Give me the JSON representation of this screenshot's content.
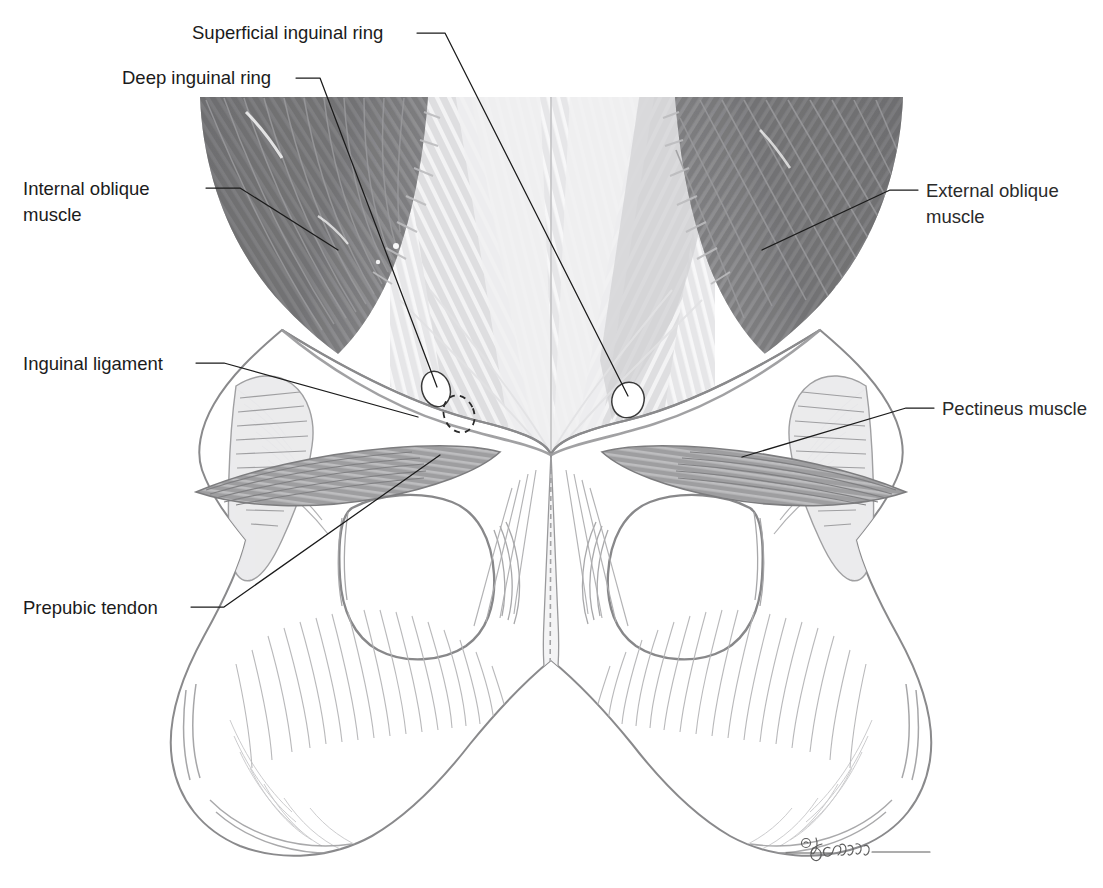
{
  "figure": {
    "background_color": "#ffffff",
    "width": 1103,
    "height": 888,
    "credit": "© D. Giddings"
  },
  "labels": {
    "superficial_inguinal_ring": "Superficial inguinal ring",
    "deep_inguinal_ring": "Deep inguinal ring",
    "internal_oblique_line1": "Internal oblique",
    "internal_oblique_line2": "muscle",
    "inguinal_ligament": "Inguinal ligament",
    "prepubic_tendon": "Prepubic tendon",
    "external_oblique_line1": "External oblique",
    "external_oblique_line2": "muscle",
    "pectineus_muscle": "Pectineus muscle"
  },
  "colors": {
    "text": "#1b1b1b",
    "leader_line": "#1b1b1b",
    "dark_muscle": "#6f6f70",
    "dark_muscle_shadow": "#58585a",
    "mid_muscle": "#a8a8aa",
    "aponeurosis_light": "#dcdcde",
    "aponeurosis_lighter": "#ededef",
    "bone_outline": "#8e8e90",
    "bone_hatch": "#a9a9ab",
    "pectineus": "#9a9a9c",
    "ring_fill": "#ffffff",
    "signature": "#5d5d5d"
  },
  "structures": {
    "deep_inguinal_ring": {
      "cx": 436,
      "cy": 389,
      "rx": 14,
      "ry": 18,
      "style": "solid-outline-white-oval"
    },
    "deep_ring_dashed": {
      "cx": 459,
      "cy": 414,
      "rx": 15,
      "ry": 19,
      "style": "dashed-outline"
    },
    "superficial_inguinal_ring": {
      "cx": 628,
      "cy": 400,
      "rx": 16,
      "ry": 18,
      "style": "solid-outline-white-oval"
    },
    "obturator_foramen_left": {
      "cx": 410,
      "cy": 565
    },
    "obturator_foramen_right": {
      "cx": 700,
      "cy": 565
    }
  }
}
